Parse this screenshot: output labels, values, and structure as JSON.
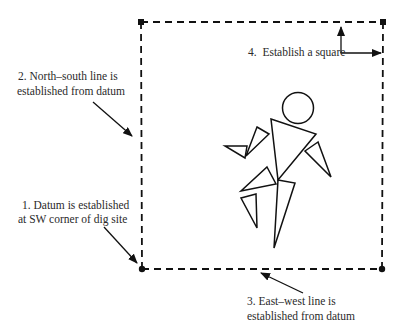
{
  "diagram": {
    "colors": {
      "stroke": "#111111",
      "text": "#2a2a2a",
      "background": "#ffffff"
    },
    "site_square": {
      "corners": {
        "nw": [
          141,
          22
        ],
        "ne": [
          383,
          22
        ],
        "se": [
          382,
          269
        ],
        "sw": [
          142,
          269
        ]
      },
      "line_style": "dashed",
      "corner_marker": "filled-dot"
    },
    "labels": {
      "step1": {
        "line1": "1. Datum is established",
        "line2": "at SW corner of dig site"
      },
      "step2": {
        "line1": "2. North–south line is",
        "line2": "established from datum"
      },
      "step3": {
        "line1": "3. East–west line is",
        "line2": "established from datum"
      },
      "step4": {
        "line1": "4.  Establish a square"
      }
    },
    "figure": {
      "description": "Stylized running figure made of a circle (head) and triangles (body, arms, legs)",
      "icon": "running-person-icon"
    }
  }
}
